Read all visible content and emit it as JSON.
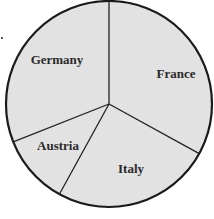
{
  "chart_data": {
    "type": "pie",
    "title": "",
    "start_angle_deg": 0,
    "direction": "clockwise",
    "categories": [
      "France",
      "Italy",
      "Austria",
      "Germany"
    ],
    "values": [
      33,
      25,
      11,
      31
    ],
    "units": "percent (estimated from slice angles; no values shown)",
    "labels_inside": true,
    "legend": "none",
    "colors": {
      "fill": "#e2e2e2",
      "outline": "#1a1a1a",
      "divider": "#222222",
      "label": "#2a2a2a",
      "background": "#ffffff"
    },
    "geometry": {
      "cx": 109,
      "cy": 104,
      "r": 103
    },
    "label_positions": [
      {
        "name": "France",
        "x": 176,
        "y": 78
      },
      {
        "name": "Italy",
        "x": 131,
        "y": 173
      },
      {
        "name": "Austria",
        "x": 58,
        "y": 150
      },
      {
        "name": "Germany",
        "x": 57,
        "y": 64
      }
    ]
  }
}
